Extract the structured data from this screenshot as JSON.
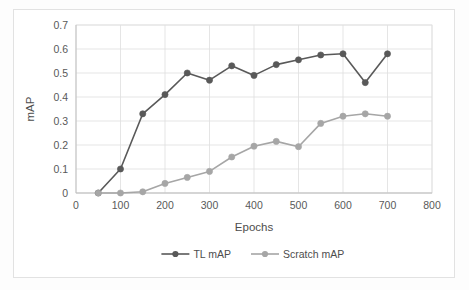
{
  "chart_data": {
    "type": "line",
    "title": "",
    "xlabel": "Epochs",
    "ylabel": "mAP",
    "x": [
      50,
      100,
      150,
      200,
      250,
      300,
      350,
      400,
      450,
      500,
      550,
      600,
      650,
      700
    ],
    "xlim": [
      0,
      800
    ],
    "ylim": [
      0,
      0.7
    ],
    "xticks": [
      0,
      100,
      200,
      300,
      400,
      500,
      600,
      700,
      800
    ],
    "xtick_labels": [
      "0",
      "100",
      "200",
      "300",
      "400",
      "500",
      "600",
      "700",
      "800"
    ],
    "yticks": [
      0,
      0.1,
      0.2,
      0.3,
      0.4,
      0.5,
      0.6,
      0.7
    ],
    "ytick_labels": [
      "0",
      "0.1",
      "0.2",
      "0.3",
      "0.4",
      "0.5",
      "0.6",
      "0.7"
    ],
    "grid": "horizontal-and-vertical",
    "legend_position": "bottom-center",
    "series": [
      {
        "name": "TL mAP",
        "color": "#595959",
        "marker": "circle",
        "values": [
          0,
          0.1,
          0.33,
          0.41,
          0.5,
          0.47,
          0.53,
          0.49,
          0.535,
          0.555,
          0.575,
          0.58,
          0.46,
          0.58
        ]
      },
      {
        "name": "Scratch mAP",
        "color": "#a6a6a6",
        "marker": "circle",
        "values": [
          0,
          0,
          0.005,
          0.04,
          0.065,
          0.09,
          0.15,
          0.195,
          0.215,
          0.193,
          0.29,
          0.32,
          0.33,
          0.32
        ]
      }
    ]
  },
  "axes": {
    "y_title": "mAP",
    "x_title": "Epochs"
  },
  "legend": {
    "items": [
      {
        "label": "TL mAP",
        "color": "#595959"
      },
      {
        "label": "Scratch mAP",
        "color": "#a6a6a6"
      }
    ]
  },
  "colors": {
    "series_tl": "#595959",
    "series_scratch": "#a6a6a6",
    "gridline": "#dedede",
    "axis": "#bfbfbf",
    "text": "#4d4d4d",
    "frame": "#e2e2e2"
  }
}
